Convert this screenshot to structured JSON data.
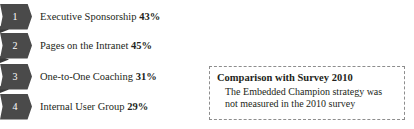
{
  "chart_data": {
    "type": "bar",
    "title": "",
    "xlabel": "",
    "ylabel": "",
    "categories": [
      "Executive Sponsorship",
      "Pages on the Intranet",
      "One-to-One Coaching",
      "Internal User Group"
    ],
    "values": [
      43,
      45,
      31,
      29
    ],
    "value_suffix": "%",
    "ranks": [
      "1",
      "2",
      "3",
      "4"
    ],
    "legend": [],
    "grid": false
  },
  "ribbons": {
    "items": [
      {
        "rank": "1",
        "label": "Executive Sponsorship",
        "value": "43%"
      },
      {
        "rank": "2",
        "label": "Pages on the Intranet",
        "value": "45%"
      },
      {
        "rank": "3",
        "label": "One-to-One Coaching",
        "value": "31%"
      },
      {
        "rank": "4",
        "label": "Internal User Group",
        "value": "29%"
      }
    ]
  },
  "callout": {
    "title": "Comparison with Survey 2010",
    "body_line_1": "The Embedded Champion strategy was",
    "body_line_2": "not measured in the 2010 survey"
  },
  "colors": {
    "ribbon_fill": "#4a4a4a",
    "ribbon_joint": "#3a3a3a",
    "ribbon_number": "#ffffff",
    "text": "#231f20",
    "callout_border": "#8d8d8d",
    "background": "#ffffff"
  }
}
